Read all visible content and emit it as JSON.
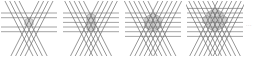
{
  "figure": {
    "title": "",
    "caption": "",
    "background_color": "#ffffff",
    "continuation_marker": "...",
    "panel_count": 4,
    "panels": [
      {
        "index": 1,
        "label": "",
        "lines_per_direction": 4,
        "total_lines": 12,
        "shaded_cells": 1,
        "shaded_region": "hexagon",
        "x": 0
      },
      {
        "index": 2,
        "label": "",
        "lines_per_direction": 5,
        "total_lines": 15,
        "shaded_cells": 3,
        "shaded_region": "hexagon",
        "x": 62
      },
      {
        "index": 3,
        "label": "",
        "lines_per_direction": 6,
        "total_lines": 18,
        "shaded_cells": 7,
        "shaded_region": "hexagon",
        "x": 124
      },
      {
        "index": 4,
        "label": "",
        "lines_per_direction": 7,
        "total_lines": 21,
        "shaded_cells": 12,
        "shaded_region": "hexagon",
        "x": 186
      }
    ],
    "line_directions_deg": [
      0,
      60,
      120
    ],
    "colors": {
      "line_dark": "#555555",
      "line_light": "#9a9a9a",
      "line_faint": "#c8c8c8",
      "cell_fill": "#d4d4d4",
      "cell_stroke": "#8e8e8e",
      "background": "#ffffff",
      "ellipsis": "#b9b9b9"
    }
  },
  "chart_data": {
    "type": "diagram",
    "title": "",
    "xlabel": "",
    "ylabel": "",
    "categories": [
      "panel 1",
      "panel 2",
      "panel 3",
      "panel 4"
    ],
    "series": [
      {
        "name": "lines per direction",
        "values": [
          4,
          5,
          6,
          7
        ]
      },
      {
        "name": "total lines",
        "values": [
          12,
          15,
          18,
          21
        ]
      },
      {
        "name": "shaded cells",
        "values": [
          1,
          3,
          7,
          12
        ]
      }
    ]
  }
}
